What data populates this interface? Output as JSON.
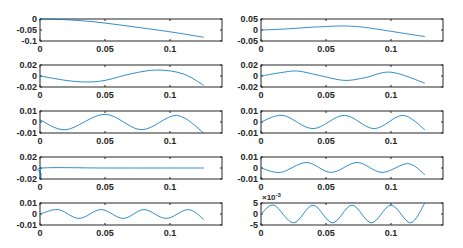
{
  "figure": {
    "background": "#ffffff",
    "line_color": "#0072BD",
    "axis_color": "#262626"
  },
  "chart_data": [
    {
      "type": "line",
      "title": "",
      "xlabel": "",
      "ylabel": "",
      "grid": false,
      "xlim": [
        0,
        0.14
      ],
      "ylim": [
        -0.1,
        0
      ],
      "xticks": [
        "0",
        "0.05",
        "0.1"
      ],
      "yticks": [
        "0",
        "-0.05",
        "-0.1"
      ],
      "x": [
        0,
        0.02,
        0.04,
        0.06,
        0.08,
        0.1,
        0.126
      ],
      "values": [
        0,
        -0.003,
        -0.012,
        -0.026,
        -0.042,
        -0.058,
        -0.083
      ]
    },
    {
      "type": "line",
      "title": "",
      "xlabel": "",
      "ylabel": "",
      "grid": false,
      "xlim": [
        0,
        0.14
      ],
      "ylim": [
        -0.05,
        0.05
      ],
      "xticks": [
        "0",
        "0.05",
        "0.1"
      ],
      "yticks": [
        "0.05",
        "0",
        "-0.05"
      ],
      "x": [
        0,
        0.02,
        0.04,
        0.06,
        0.07,
        0.08,
        0.1,
        0.126
      ],
      "values": [
        0,
        0.005,
        0.013,
        0.018,
        0.017,
        0.012,
        -0.006,
        -0.03
      ]
    },
    {
      "type": "line",
      "title": "",
      "xlabel": "",
      "ylabel": "",
      "grid": false,
      "xlim": [
        0,
        0.14
      ],
      "ylim": [
        -0.02,
        0.02
      ],
      "xticks": [
        "0",
        "0.05",
        "0.1"
      ],
      "yticks": [
        "0.02",
        "0",
        "-0.02"
      ],
      "x": [
        0,
        0.02,
        0.035,
        0.05,
        0.07,
        0.09,
        0.11,
        0.126
      ],
      "values": [
        0,
        -0.008,
        -0.011,
        -0.008,
        0.004,
        0.011,
        0.004,
        -0.017
      ]
    },
    {
      "type": "line",
      "title": "",
      "xlabel": "",
      "ylabel": "",
      "grid": false,
      "xlim": [
        0,
        0.14
      ],
      "ylim": [
        -0.02,
        0.02
      ],
      "xticks": [
        "0",
        "0.05",
        "0.1"
      ],
      "yticks": [
        "0.02",
        "0",
        "-0.02"
      ],
      "x": [
        0,
        0.015,
        0.028,
        0.045,
        0.064,
        0.08,
        0.1,
        0.126
      ],
      "values": [
        0,
        0.006,
        0.009,
        0.001,
        -0.008,
        -0.003,
        0.007,
        -0.013
      ]
    },
    {
      "type": "line",
      "title": "",
      "xlabel": "",
      "ylabel": "",
      "grid": false,
      "xlim": [
        0,
        0.14
      ],
      "ylim": [
        -0.01,
        0.01
      ],
      "xticks": [
        "0",
        "0.05",
        "0.1"
      ],
      "yticks": [
        "0.01",
        "0",
        "-0.01"
      ],
      "x": [
        0,
        0.02,
        0.05,
        0.078,
        0.105,
        0.126
      ],
      "values": [
        0.002,
        -0.007,
        0.007,
        -0.007,
        0.006,
        -0.01
      ]
    },
    {
      "type": "line",
      "title": "",
      "xlabel": "",
      "ylabel": "",
      "grid": false,
      "xlim": [
        0,
        0.14
      ],
      "ylim": [
        -0.01,
        0.01
      ],
      "xticks": [
        "0",
        "0.05",
        "0.1"
      ],
      "yticks": [
        "0.01",
        "0",
        "-0.01"
      ],
      "x": [
        0,
        0.017,
        0.04,
        0.064,
        0.087,
        0.109,
        0.126
      ],
      "values": [
        0,
        0.006,
        -0.006,
        0.006,
        -0.006,
        0.006,
        -0.007
      ]
    },
    {
      "type": "line",
      "title": "",
      "xlabel": "",
      "ylabel": "",
      "grid": false,
      "xlim": [
        0,
        0.14
      ],
      "ylim": [
        -0.02,
        0.02
      ],
      "xticks": [
        "0",
        "0.05",
        "0.1"
      ],
      "yticks": [
        "0.02",
        "0",
        "-0.02"
      ],
      "x": [
        0,
        0.0005,
        0.001,
        0.002,
        0.05,
        0.1,
        0.126
      ],
      "values": [
        0,
        -0.018,
        -0.01,
        0,
        0,
        0,
        0
      ]
    },
    {
      "type": "line",
      "title": "",
      "xlabel": "",
      "ylabel": "",
      "grid": false,
      "xlim": [
        0,
        0.14
      ],
      "ylim": [
        -0.01,
        0.01
      ],
      "xticks": [
        "0",
        "0.05",
        "0.1"
      ],
      "yticks": [
        "0.01",
        "0",
        "-0.01"
      ],
      "x": [
        0,
        0.015,
        0.035,
        0.054,
        0.074,
        0.093,
        0.113,
        0.126
      ],
      "values": [
        0,
        -0.004,
        0.005,
        -0.004,
        0.005,
        -0.004,
        0.004,
        -0.006
      ]
    },
    {
      "type": "line",
      "title": "",
      "xlabel": "",
      "ylabel": "",
      "grid": false,
      "xlim": [
        0,
        0.14
      ],
      "ylim": [
        -0.01,
        0.01
      ],
      "xticks": [
        "0",
        "0.05",
        "0.1"
      ],
      "yticks": [
        "0.01",
        "0",
        "-0.01"
      ],
      "x": [
        0,
        0.014,
        0.03,
        0.047,
        0.064,
        0.08,
        0.097,
        0.114,
        0.126
      ],
      "values": [
        0,
        0.004,
        -0.004,
        0.004,
        -0.004,
        0.004,
        -0.004,
        0.004,
        -0.005
      ]
    },
    {
      "type": "line",
      "title": "",
      "xlabel": "",
      "ylabel": "",
      "grid": false,
      "xlim": [
        0,
        0.14
      ],
      "ylim": [
        -5,
        5
      ],
      "y_exponent": "×10^-3",
      "xticks": [
        "0",
        "0.05",
        "0.1"
      ],
      "yticks": [
        "5",
        "0",
        "-5"
      ],
      "x": [
        0,
        0.01,
        0.025,
        0.04,
        0.055,
        0.07,
        0.085,
        0.1,
        0.115,
        0.126
      ],
      "values": [
        0,
        4,
        -4,
        4,
        -4,
        4,
        -4,
        4,
        -4,
        5
      ]
    }
  ]
}
